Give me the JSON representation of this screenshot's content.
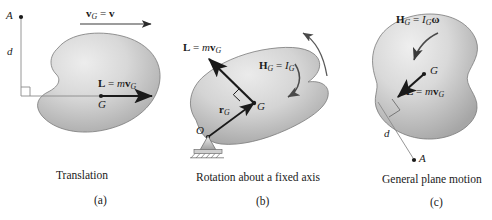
{
  "figure": {
    "width": 492,
    "height": 220,
    "background_color": "#ffffff",
    "ink_color": "#1a1a1a",
    "body_fill_light": "#e9e9e9",
    "body_fill_mid": "#c9c9c9",
    "body_fill_dark": "#9a9a9a",
    "outline_color": "#6e6e6e"
  },
  "panels": [
    {
      "id": "a",
      "letter": "(a)",
      "caption": "Translation",
      "point_A": "A",
      "distance_label": "d",
      "velocity_label_bold": "v",
      "velocity_label_sub": "G",
      "velocity_label_eq": "=",
      "velocity_label_rhs": "v",
      "momentum_L": "L",
      "momentum_eq": "=",
      "momentum_m": "m",
      "momentum_v": "v",
      "momentum_sub": "G",
      "center_label": "G",
      "right_angle_marker": "right-angle-square"
    },
    {
      "id": "b",
      "letter": "(b)",
      "caption": "Rotation about a fixed axis",
      "momentum_L": "L",
      "momentum_eq": "=",
      "momentum_m": "m",
      "momentum_v": "v",
      "momentum_sub": "G",
      "angular_H": "H",
      "angular_H_sub": "G",
      "angular_eq": "=",
      "angular_I": "I",
      "angular_I_sub": "G",
      "position_vector_r": "r",
      "position_vector_sub": "G",
      "pivot_label": "O",
      "center_label": "G",
      "support_type": "pin-support",
      "rotation_arrow": "counterclockwise-curved-arrow"
    },
    {
      "id": "c",
      "letter": "(c)",
      "caption": "General plane motion",
      "angular_H": "H",
      "angular_H_sub": "G",
      "angular_eq": "=",
      "angular_I": "I",
      "angular_I_sub": "G",
      "angular_omega": "ω",
      "momentum_L": "L",
      "momentum_eq": "=",
      "momentum_m": "m",
      "momentum_v": "v",
      "momentum_sub": "G",
      "center_label": "G",
      "point_A": "A",
      "distance_label": "d",
      "right_angle_marker": "right-angle-square",
      "rotation_arrow": "clockwise-curved-arrow"
    }
  ]
}
